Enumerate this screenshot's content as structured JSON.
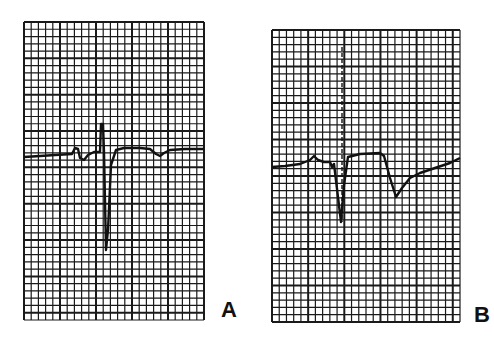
{
  "figure": {
    "type": "ECG tracing comparison",
    "colors": {
      "grid": "#1a1a1a",
      "trace": "#111111",
      "paper": "#ffffff"
    },
    "panels": [
      {
        "id": "A",
        "label": "A",
        "bounds": {
          "x": 24,
          "y": 22,
          "width": 180,
          "height": 298
        },
        "grid": {
          "minor_px": 7.3,
          "major_every": 5
        },
        "trace_description": "Baseline with small P wave, narrow upright spike followed by deep negative QRS deflection, then ST segment and shallow inverted T wave",
        "trace_points": [
          [
            24,
            157
          ],
          [
            40,
            156
          ],
          [
            55,
            155
          ],
          [
            72,
            154
          ],
          [
            75,
            148
          ],
          [
            78,
            149
          ],
          [
            80,
            158
          ],
          [
            84,
            160
          ],
          [
            88,
            155
          ],
          [
            94,
            152
          ],
          [
            100,
            152
          ],
          [
            101,
            124
          ],
          [
            103,
            124
          ],
          [
            104,
            152
          ],
          [
            106,
            250
          ],
          [
            108,
            230
          ],
          [
            111,
            165
          ],
          [
            116,
            150
          ],
          [
            124,
            148
          ],
          [
            140,
            148
          ],
          [
            150,
            149
          ],
          [
            156,
            154
          ],
          [
            160,
            156
          ],
          [
            164,
            153
          ],
          [
            170,
            150
          ],
          [
            185,
            149
          ],
          [
            204,
            149
          ]
        ],
        "pacing_spike": null
      },
      {
        "id": "B",
        "label": "B",
        "bounds": {
          "x": 272,
          "y": 30,
          "width": 188,
          "height": 292
        },
        "grid": {
          "minor_px": 7.3,
          "major_every": 5
        },
        "trace_description": "Low baseline with small P wave, dashed pacemaker spike, wide QRS with elevated plateau, then deep inverted T wave recovering toward baseline",
        "trace_points": [
          [
            272,
            167
          ],
          [
            285,
            166
          ],
          [
            300,
            164
          ],
          [
            310,
            160
          ],
          [
            314,
            156
          ],
          [
            318,
            160
          ],
          [
            324,
            162
          ],
          [
            330,
            162
          ],
          [
            332,
            167
          ],
          [
            334,
            164
          ],
          [
            341,
            222
          ],
          [
            344,
            185
          ],
          [
            348,
            157
          ],
          [
            360,
            154
          ],
          [
            380,
            153
          ],
          [
            384,
            156
          ],
          [
            390,
            178
          ],
          [
            396,
            197
          ],
          [
            402,
            188
          ],
          [
            410,
            178
          ],
          [
            420,
            173
          ],
          [
            435,
            168
          ],
          [
            450,
            163
          ],
          [
            460,
            158
          ]
        ],
        "pacing_spike": {
          "x": 342,
          "y_top": 47,
          "y_bottom": 222,
          "style": "dashed"
        }
      }
    ]
  }
}
